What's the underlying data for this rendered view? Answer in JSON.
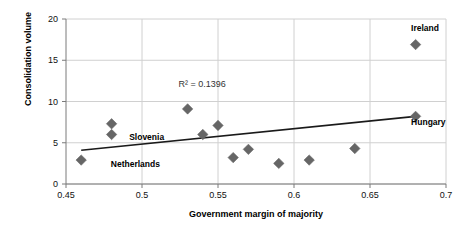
{
  "chart_data": {
    "type": "scatter",
    "title": "",
    "xlabel": "Government margin of majority",
    "ylabel": "Consolidation volume",
    "xlim": [
      0.45,
      0.7
    ],
    "ylim": [
      0,
      20
    ],
    "xticks": [
      "0.45",
      "0.5",
      "0.55",
      "0.6",
      "0.65",
      "0.7"
    ],
    "xtick_values": [
      0.45,
      0.5,
      0.55,
      0.6,
      0.65,
      0.7
    ],
    "yticks": [
      "0",
      "5",
      "10",
      "15",
      "20"
    ],
    "ytick_values": [
      0,
      5,
      10,
      15,
      20
    ],
    "grid": "both",
    "legend": "none",
    "marker_shape": "diamond",
    "marker_color": "#666666",
    "trendline_color": "#1a1a1a",
    "points": [
      {
        "x": 0.46,
        "y": 2.9,
        "label": "Netherlands"
      },
      {
        "x": 0.48,
        "y": 7.3,
        "label": ""
      },
      {
        "x": 0.48,
        "y": 6.0,
        "label": "Slovenia"
      },
      {
        "x": 0.53,
        "y": 9.1,
        "label": ""
      },
      {
        "x": 0.54,
        "y": 6.0,
        "label": ""
      },
      {
        "x": 0.55,
        "y": 7.1,
        "label": ""
      },
      {
        "x": 0.56,
        "y": 3.2,
        "label": ""
      },
      {
        "x": 0.57,
        "y": 4.2,
        "label": ""
      },
      {
        "x": 0.59,
        "y": 2.5,
        "label": ""
      },
      {
        "x": 0.61,
        "y": 2.9,
        "label": ""
      },
      {
        "x": 0.64,
        "y": 4.3,
        "label": ""
      },
      {
        "x": 0.68,
        "y": 16.9,
        "label": "Ireland"
      },
      {
        "x": 0.68,
        "y": 8.2,
        "label": "Hungary"
      }
    ],
    "trendline": {
      "x0": 0.46,
      "y0": 4.1,
      "x1": 0.68,
      "y1": 8.2
    },
    "annotations": [
      {
        "text": "R² = 0.1396",
        "x": 0.545,
        "y": 12.0
      }
    ],
    "point_labels": [
      {
        "text": "Netherlands",
        "anchor_x": 0.465,
        "anchor_y": 2.8,
        "dx": 22,
        "dy": 4
      },
      {
        "text": "Slovenia",
        "anchor_x": 0.483,
        "anchor_y": 6.0,
        "dx": 13,
        "dy": 3
      },
      {
        "text": "Ireland",
        "anchor_x": 0.681,
        "anchor_y": 16.9,
        "dx": -6,
        "dy": -16
      },
      {
        "text": "Hungary",
        "anchor_x": 0.681,
        "anchor_y": 8.2,
        "dx": -6,
        "dy": 7
      }
    ]
  },
  "axes": {
    "y_title": "Consolidation volume",
    "x_title": "Government margin of majority"
  }
}
